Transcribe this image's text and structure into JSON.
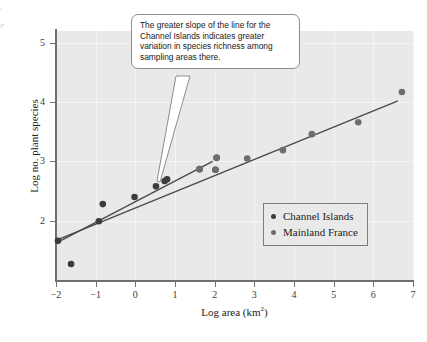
{
  "margin_fragment": {
    "line1": "f",
    "line2": "or"
  },
  "callout": {
    "text": "The greater slope of the line for the Channel Islands indicates greater variation in species richness among sampling areas there."
  },
  "legend": {
    "items": [
      {
        "label": "Channel Islands",
        "color": "#3c3c3c"
      },
      {
        "label": "Mainland France",
        "color": "#6e6e6e"
      }
    ]
  },
  "colors": {
    "plot_background": "#e9e9e9",
    "gridline": "#f4f4f4",
    "axis": "#6f6f6f",
    "channel_islands": "#3c3c3c",
    "mainland_france": "#6e6e6e",
    "trendline": "#4a4a4a"
  },
  "chart_data": {
    "type": "scatter",
    "title": "",
    "xlabel": "Log area (km2)",
    "xlabel_html": "Log area (km<sup>2</sup>)",
    "ylabel": "Log no. plant species",
    "xlim": [
      -2,
      7
    ],
    "ylim": [
      1.0,
      5.2
    ],
    "xticks": [
      -2,
      -1,
      0,
      1,
      2,
      3,
      4,
      5,
      6,
      7
    ],
    "xticklabels": [
      "−2",
      "−1",
      "0",
      "1",
      "2",
      "3",
      "4",
      "5",
      "6",
      "7"
    ],
    "yticks": [
      2,
      3,
      4,
      5
    ],
    "yticklabels": [
      "2",
      "3",
      "4",
      "5"
    ],
    "grid": true,
    "legend_position": "inner-right",
    "series": [
      {
        "name": "Channel Islands",
        "color": "#3c3c3c",
        "points": [
          {
            "x": -1.95,
            "y": 1.66
          },
          {
            "x": -1.62,
            "y": 1.27
          },
          {
            "x": -0.92,
            "y": 1.99
          },
          {
            "x": -0.82,
            "y": 2.28
          },
          {
            "x": -0.02,
            "y": 2.4
          },
          {
            "x": 0.52,
            "y": 2.58
          },
          {
            "x": 0.74,
            "y": 2.67
          },
          {
            "x": 0.8,
            "y": 2.7
          },
          {
            "x": 1.62,
            "y": 2.87
          },
          {
            "x": 2.02,
            "y": 2.86
          },
          {
            "x": 2.05,
            "y": 3.06
          }
        ],
        "fit_line": {
          "x0": -2.0,
          "y0": 1.62,
          "x1": 1.95,
          "y1": 3.0
        }
      },
      {
        "name": "Mainland France",
        "color": "#6e6e6e",
        "points": [
          {
            "x": 1.62,
            "y": 2.87
          },
          {
            "x": 2.02,
            "y": 2.86
          },
          {
            "x": 2.05,
            "y": 3.06
          },
          {
            "x": 2.82,
            "y": 3.05
          },
          {
            "x": 3.72,
            "y": 3.19
          },
          {
            "x": 4.45,
            "y": 3.46
          },
          {
            "x": 5.62,
            "y": 3.66
          },
          {
            "x": 6.72,
            "y": 4.17
          }
        ],
        "fit_line": {
          "x0": -2.0,
          "y0": 1.67,
          "x1": 6.62,
          "y1": 4.02
        }
      }
    ]
  }
}
